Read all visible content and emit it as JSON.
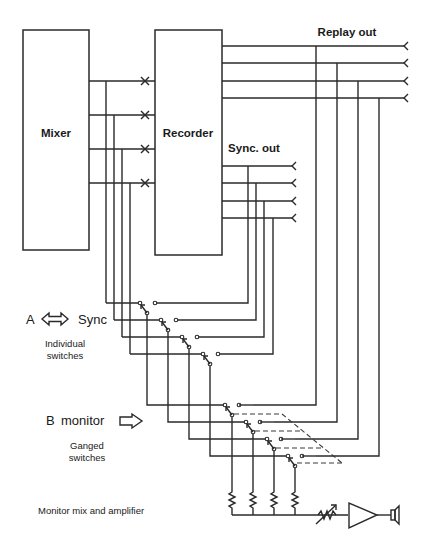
{
  "diagram": {
    "blocks": {
      "mixer": "Mixer",
      "recorder": "Recorder"
    },
    "outputs": {
      "replay_out": "Replay out",
      "sync_out": "Sync. out"
    },
    "mode_a": {
      "letter": "A",
      "arrow": "double-arrow-icon",
      "label": "Sync",
      "note_line1": "Individual",
      "note_line2": "switches"
    },
    "mode_b": {
      "letter": "B",
      "label": "monitor",
      "arrow": "right-arrow-icon",
      "note_line1": "Ganged",
      "note_line2": "switches"
    },
    "monitor_section": "Monitor mix and amplifier",
    "channel_count": 4,
    "colors": {
      "line": "#2a2a2a",
      "background": "#ffffff"
    }
  }
}
